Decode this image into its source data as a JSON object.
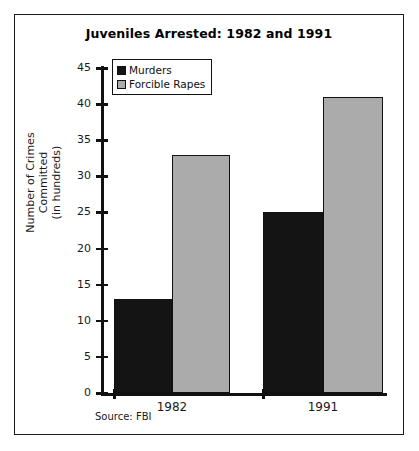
{
  "chart_data": {
    "type": "bar",
    "title": "Juveniles Arrested: 1982 and 1991",
    "categories": [
      "1982",
      "1991"
    ],
    "series": [
      {
        "name": "Murders",
        "values": [
          13,
          25
        ],
        "color": "#141414"
      },
      {
        "name": "Forcible Rapes",
        "values": [
          33,
          41
        ],
        "color": "#ababab"
      }
    ],
    "xlabel": "",
    "ylabel": "Number of Crimes Committed (in hundreds)",
    "ylabel_lines": [
      "Number of Crimes",
      "Committed",
      "(in hundreds)"
    ],
    "ylim": [
      0,
      45
    ],
    "ytick_step": 5,
    "yticks": [
      "45",
      "40",
      "35",
      "30",
      "25",
      "20",
      "15",
      "10",
      "5",
      "0"
    ],
    "grid": false,
    "legend_position": "top-left",
    "source_note": "Source: FBI"
  },
  "figure": {
    "border_color": "#1a1a1a",
    "background": "#ffffff"
  }
}
